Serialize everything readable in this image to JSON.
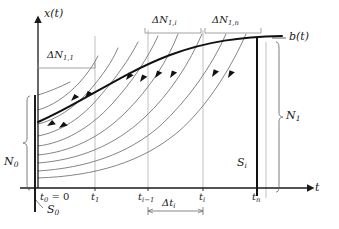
{
  "figure": {
    "type": "line-diagram",
    "title": "",
    "axes": {
      "y_label": "x(t)",
      "x_label": "t",
      "y_axis_name": "x(t)",
      "x_axis_name": "t"
    },
    "curves": {
      "boundary_label": "b(t)",
      "boundary_description": "bold concave increasing boundary curve b(t)",
      "trajectory_count": 9,
      "arrow_count": 10
    },
    "axis_ticks": [
      {
        "id": "t0",
        "label": "t",
        "sub": "0",
        "suffix": " = 0",
        "x": 38
      },
      {
        "id": "t1",
        "label": "t",
        "sub": "1",
        "suffix": "",
        "x": 95
      },
      {
        "id": "ti_1",
        "label": "t",
        "sub": "i−1",
        "suffix": "",
        "x": 148
      },
      {
        "id": "ti",
        "label": "t",
        "sub": "i",
        "suffix": "",
        "x": 203
      },
      {
        "id": "tn",
        "label": "t",
        "sub": "n",
        "suffix": "",
        "x": 257
      }
    ],
    "annotations": {
      "delta_n_1": {
        "label": "ΔN",
        "sub": "1,1",
        "x0": 38,
        "x1": 95
      },
      "delta_n_i": {
        "label": "ΔN",
        "sub": "1,i",
        "x0": 145,
        "x1": 201
      },
      "delta_n_n": {
        "label": "ΔN",
        "sub": "1,n",
        "x0": 205,
        "x1": 261
      },
      "delta_t_i": {
        "label": "Δt",
        "sub": "i",
        "x0": 148,
        "x1": 203
      },
      "n0": {
        "label": "N",
        "sub": "0"
      },
      "n1": {
        "label": "N",
        "sub": "1"
      },
      "s0": {
        "label": "S",
        "sub": "0"
      },
      "si": {
        "label": "S",
        "sub": "i"
      }
    },
    "colors": {
      "bold_stroke": "#111111",
      "thin_stroke": "#666666",
      "grid_stroke": "#9a9a9a",
      "text": "#1a1a1a",
      "background": "#ffffff"
    }
  }
}
